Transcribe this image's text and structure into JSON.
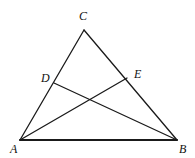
{
  "figure": {
    "kind": "geometry-diagram",
    "canvas": {
      "width": 195,
      "height": 158,
      "background": "#ffffff"
    },
    "stroke": {
      "color": "#1a1a1a",
      "width": 1.3,
      "base_width": 2.0
    },
    "points": [
      {
        "id": "C",
        "label": "C",
        "x": 84,
        "y": 30,
        "label_x": 79,
        "label_y": 10
      },
      {
        "id": "A",
        "label": "A",
        "x": 20,
        "y": 140,
        "label_x": 10,
        "label_y": 143
      },
      {
        "id": "B",
        "label": "B",
        "x": 177,
        "y": 140,
        "label_x": 179,
        "label_y": 143
      },
      {
        "id": "D",
        "label": "D",
        "x": 54,
        "y": 83,
        "label_x": 41,
        "label_y": 72
      },
      {
        "id": "E",
        "label": "E",
        "x": 127,
        "y": 78,
        "label_x": 134,
        "label_y": 68
      }
    ],
    "segments": [
      {
        "id": "AC",
        "from": "A",
        "to": "C",
        "kind": "side"
      },
      {
        "id": "CB",
        "from": "C",
        "to": "B",
        "kind": "side"
      },
      {
        "id": "AB",
        "from": "A",
        "to": "B",
        "kind": "base"
      },
      {
        "id": "DB",
        "from": "D",
        "to": "B",
        "kind": "cevian"
      },
      {
        "id": "AE",
        "from": "A",
        "to": "E",
        "kind": "cevian"
      }
    ],
    "labels": {
      "C": "C",
      "A": "A",
      "B": "B",
      "D": "D",
      "E": "E"
    }
  }
}
